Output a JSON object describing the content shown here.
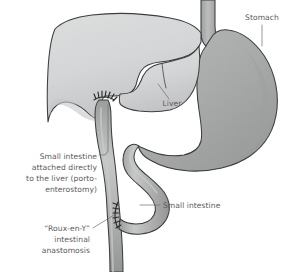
{
  "figure": {
    "background_color": "#ffffff",
    "width": 295,
    "height": 272
  },
  "colors": {
    "liver_fill": "#d6d7d8",
    "liver_shade": "#c4c5c6",
    "stomach_fill": "#a9abaa",
    "stomach_shade": "#9a9c9b",
    "intestine_fill": "#aeb0af",
    "intestine_highlight": "#c8cac9",
    "esophagus_fill": "#a9abaa",
    "outline": "#3d3d40",
    "text": "#5b5b5d",
    "leader": "#6d6d6f",
    "suture": "#2a2a2c"
  },
  "labels": {
    "stomach": {
      "text": "Stomach",
      "x": 262,
      "y": 20,
      "anchor": "middle"
    },
    "liver": {
      "text": "Liver",
      "x": 172,
      "y": 104,
      "anchor": "middle"
    },
    "small_intestine_right": {
      "text": "Small intestine",
      "x": 163,
      "y": 208,
      "anchor": "start"
    },
    "porto_enterostomy": {
      "lines": [
        "Small intestine",
        "attached directly",
        "to the liver (porto-",
        "enterostomy)"
      ],
      "x": 97,
      "y_start": 159,
      "line_height": 11,
      "anchor": "end"
    },
    "roux_en_y": {
      "lines": [
        "“Roux-en-Y”",
        "intestinal",
        "anastomosis"
      ],
      "x": 90,
      "y_start": 231,
      "line_height": 11,
      "anchor": "end"
    }
  },
  "anatomy": {
    "organs": [
      {
        "name": "liver",
        "label": "Liver"
      },
      {
        "name": "stomach",
        "label": "Stomach"
      },
      {
        "name": "esophagus",
        "label": "Esophagus"
      },
      {
        "name": "duodenum-jejunum-loop",
        "label": "Small intestine"
      },
      {
        "name": "roux-limb",
        "label": "Roux limb"
      }
    ],
    "suture_sites": [
      {
        "name": "portoenterostomy-suture-line",
        "label": "Porto-enterostomy"
      },
      {
        "name": "roux-en-y-suture-line",
        "label": "Roux-en-Y anastomosis"
      }
    ]
  }
}
